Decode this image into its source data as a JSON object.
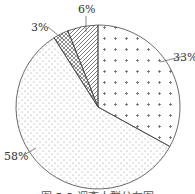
{
  "chart_data": {
    "type": "pie",
    "title": "",
    "caption": "图 5-3 调查人群分布图",
    "slices": [
      {
        "label": "33%",
        "value": 33,
        "pattern": "plus-dots"
      },
      {
        "label": "58%",
        "value": 58,
        "pattern": "fine-dots"
      },
      {
        "label": "3%",
        "value": 3,
        "pattern": "crosshatch"
      },
      {
        "label": "6%",
        "value": 6,
        "pattern": "diagonal-hatch"
      }
    ],
    "start_angle_deg": 0,
    "direction": "clockwise",
    "legend": "none",
    "colors": {
      "stroke": "#444444",
      "fill": "#ffffff",
      "text": "#333333"
    }
  },
  "labels": {
    "l33": "33%",
    "l58": "58%",
    "l3": "3%",
    "l6": "6%",
    "caption": "图 5-3 调查人群分布图"
  }
}
